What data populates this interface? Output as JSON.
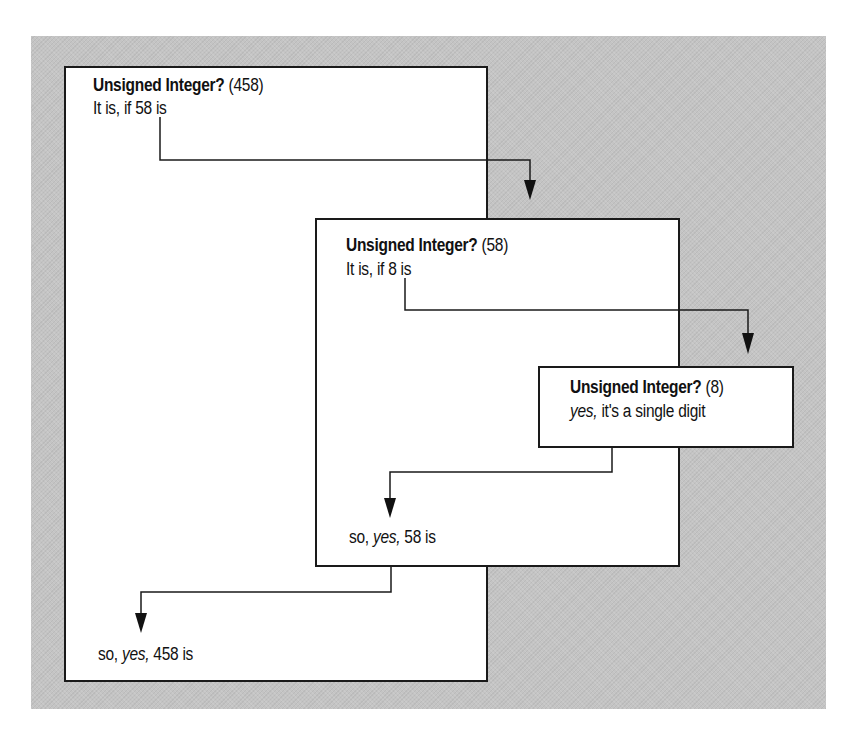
{
  "diagram": {
    "type": "recursive-call-trace",
    "colors": {
      "panel_background": "#c4c4c4",
      "box_fill": "#ffffff",
      "border": "#1a1a1a",
      "text": "#111111"
    },
    "boxes": [
      {
        "id": "call-458",
        "title": "Unsigned Integer?",
        "argument": "(458)",
        "condition": "It is, if 58 is",
        "result_prefix": "so,",
        "result_yes": "yes,",
        "result_suffix": "458 is"
      },
      {
        "id": "call-58",
        "title": "Unsigned Integer?",
        "argument": "(58)",
        "condition": "It is, if 8 is",
        "result_prefix": "so,",
        "result_yes": "yes,",
        "result_suffix": "58 is"
      },
      {
        "id": "call-8",
        "title": "Unsigned Integer?",
        "argument": "(8)",
        "base_yes": "yes,",
        "base_text": "it's a single digit"
      }
    ],
    "arrows": [
      {
        "from": "call-458",
        "to": "call-58",
        "direction": "call"
      },
      {
        "from": "call-58",
        "to": "call-8",
        "direction": "call"
      },
      {
        "from": "call-8",
        "to": "call-58",
        "direction": "return"
      },
      {
        "from": "call-58",
        "to": "call-458",
        "direction": "return"
      }
    ]
  }
}
